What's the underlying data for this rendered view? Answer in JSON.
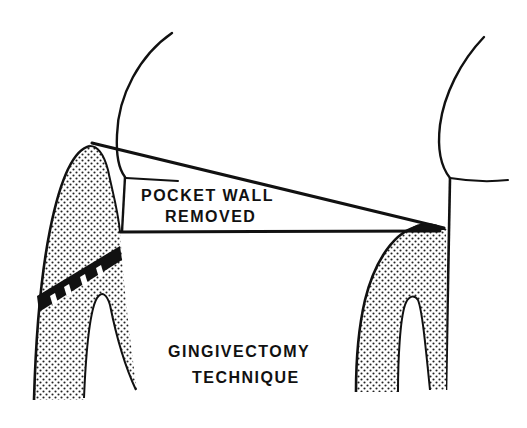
{
  "diagram": {
    "labels": {
      "pocket_wall_line1": "POCKET WALL",
      "pocket_wall_line2": "REMOVED",
      "technique_line1": "GINGIVECTOMY",
      "technique_line2": "TECHNIQUE"
    },
    "colors": {
      "ink": "#111111",
      "background": "#ffffff",
      "stipple": "#222222"
    },
    "elements": [
      "left-tooth-crown-outline",
      "right-tooth-crown-outline",
      "left-gingiva-bone-stippled",
      "right-gingiva-bone-stippled",
      "hatched-attachment-band",
      "incision-line",
      "pocket-base-line"
    ]
  }
}
